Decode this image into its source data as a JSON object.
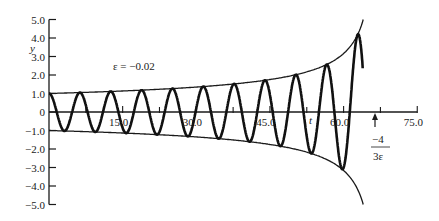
{
  "chart_data": {
    "type": "line",
    "title": "",
    "xlabel": "t",
    "ylabel": "y",
    "annotation": "ε = −0.02",
    "singularity_label": {
      "numerator": "−4",
      "denominator": "3ε"
    },
    "xlim": [
      0,
      75
    ],
    "ylim": [
      -5,
      5
    ],
    "grid": false,
    "legend": "none",
    "x_ticks": [
      15.0,
      30.0,
      45.0,
      60.0,
      75.0
    ],
    "x_tick_labels": [
      "15.0",
      "30.0",
      "45.0",
      "60.0",
      "75.0"
    ],
    "x_minor_ticks": [
      7.5,
      22.5,
      37.5,
      52.5,
      67.5
    ],
    "y_ticks": [
      5,
      4,
      3,
      2,
      1,
      0,
      -1,
      -2,
      -3,
      -4,
      -5
    ],
    "y_tick_labels": [
      "5.0",
      "4.0",
      "3.0",
      "2.0",
      "1.0",
      "0",
      "−1.0",
      "−2.0",
      "−3.0",
      "−4.0",
      "−5.0"
    ],
    "epsilon": -0.02,
    "singularity_t": 66.67,
    "model": "y = a(t)·cos(t), a(t) = (1 + 3εt/4)^(-1/2)",
    "series": [
      {
        "name": "y(t)",
        "t_start": 0,
        "t_end": 63.9,
        "peaks": {
          "t": [
            0,
            6.28,
            12.57,
            18.85,
            25.13,
            31.42,
            37.7,
            43.98,
            50.27,
            56.55,
            62.83
          ],
          "y": [
            1.0,
            1.05,
            1.11,
            1.18,
            1.27,
            1.38,
            1.52,
            1.71,
            2.02,
            2.57,
            4.17
          ]
        }
      },
      {
        "name": "upper envelope a(t)",
        "t": [
          0,
          15,
          30,
          45,
          55,
          60,
          63,
          64
        ],
        "y": [
          1.0,
          1.13,
          1.31,
          1.63,
          2.19,
          3.16,
          4.47,
          5.0
        ]
      },
      {
        "name": "lower envelope −a(t)",
        "t": [
          0,
          15,
          30,
          45,
          55,
          60,
          63,
          64
        ],
        "y": [
          -1.0,
          -1.13,
          -1.31,
          -1.63,
          -2.19,
          -3.16,
          -4.47,
          -5.0
        ]
      }
    ]
  }
}
